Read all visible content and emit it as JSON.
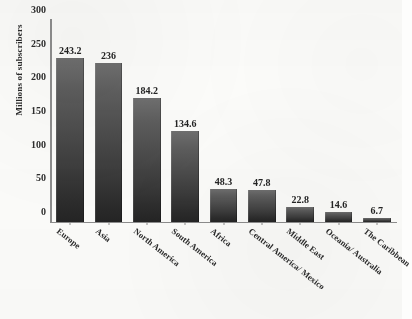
{
  "chart_data": {
    "type": "bar",
    "title": "",
    "subtitle": "",
    "xlabel": "",
    "ylabel": "Millions of subscribers",
    "ylim": [
      0,
      300
    ],
    "ytick_values": [
      0,
      50,
      100,
      150,
      200,
      250,
      300
    ],
    "ytick_labels": [
      "0",
      "50",
      "100",
      "150",
      "200",
      "250",
      "300"
    ],
    "grid": false,
    "legend": null,
    "legend_position": "none",
    "orientation": "vertical",
    "bar_color": "#4a4a4a",
    "categories": [
      "Europe",
      "Asia",
      "North America",
      "South America",
      "Africa",
      "Central America/ Mexico",
      "Middle East",
      "Oceania/ Australia",
      "The Caribbean"
    ],
    "values": [
      243.2,
      236,
      184.2,
      134.6,
      48.3,
      47.8,
      22.8,
      14.6,
      6.7
    ],
    "data_labels": [
      "243.2",
      "236",
      "184.2",
      "134.6",
      "48.3",
      "47.8",
      "22.8",
      "14.6",
      "6.7"
    ]
  }
}
